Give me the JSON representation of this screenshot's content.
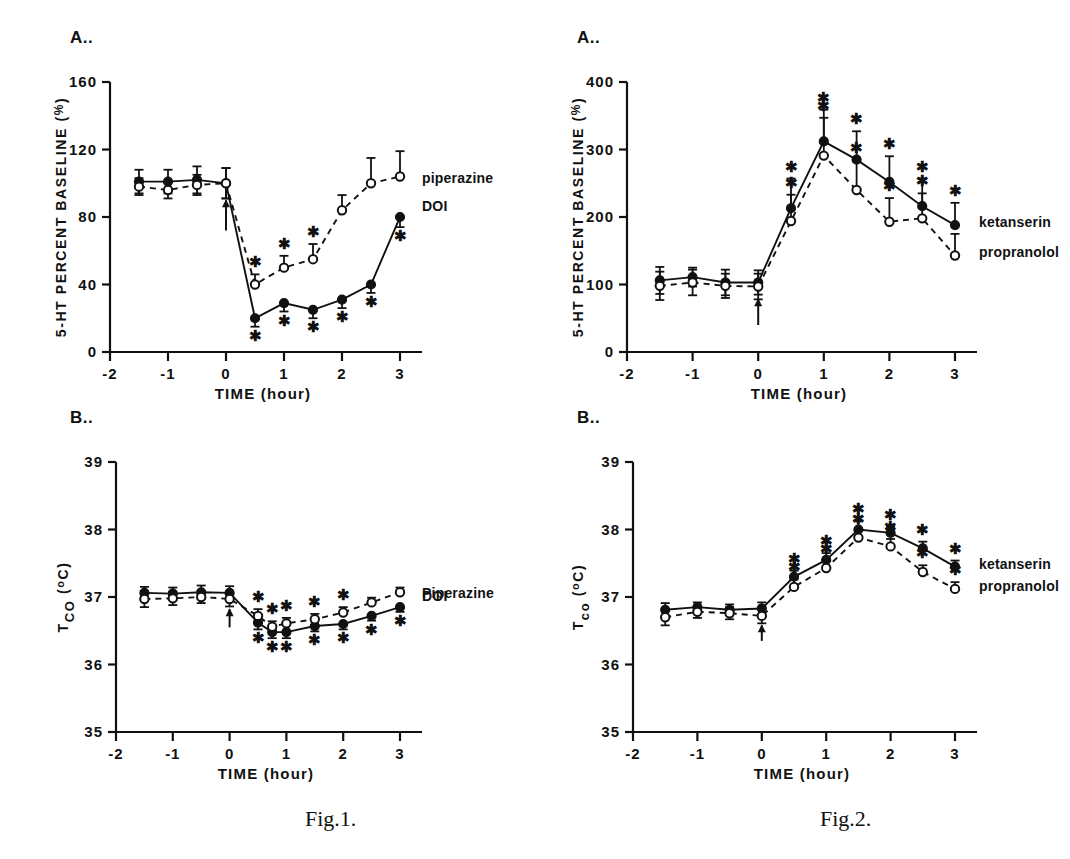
{
  "sheet": {
    "captions": [
      {
        "id": "fig1",
        "text": "Fig.1.",
        "x": 305,
        "y": 825
      },
      {
        "id": "fig2",
        "text": "Fig.2.",
        "x": 820,
        "y": 825
      }
    ]
  },
  "panels": {
    "fig1a": {
      "label": "A..",
      "ylabel": "5-HT PERCENT BASELINE (%)",
      "xlabel": "TIME (hour)",
      "legend": [
        {
          "name": "piperazine",
          "marker": "open-circle",
          "line": "dashed"
        },
        {
          "name": "DOI",
          "marker": "filled-circle",
          "line": "solid"
        }
      ]
    },
    "fig1b": {
      "label": "B..",
      "ylabel": "T co (°C)",
      "xlabel": "TIME (hour)",
      "legend": [
        {
          "name": "Piperazine",
          "marker": "open-circle",
          "line": "dashed"
        },
        {
          "name": "DOI",
          "marker": "filled-circle",
          "line": "solid"
        }
      ]
    },
    "fig2a": {
      "label": "A..",
      "ylabel": "5-HT PERCENT BASELINE (%)",
      "xlabel": "TIME (hour)",
      "legend": [
        {
          "name": "ketanserin",
          "marker": "filled-circle",
          "line": "solid"
        },
        {
          "name": "propranolol",
          "marker": "open-circle",
          "line": "dashed"
        }
      ]
    },
    "fig2b": {
      "label": "B..",
      "ylabel": "Tco (°C)",
      "xlabel": "TIME (hour)",
      "legend": [
        {
          "name": "ketanserin",
          "marker": "filled-circle",
          "line": "solid"
        },
        {
          "name": "propranolol",
          "marker": "open-circle",
          "line": "dashed"
        }
      ]
    }
  },
  "chart_data": [
    {
      "id": "fig1a",
      "type": "line",
      "title": "A..",
      "xlabel": "TIME (hour)",
      "ylabel": "5-HT PERCENT BASELINE (%)",
      "xlim": [
        -2,
        3
      ],
      "ylim": [
        0,
        160
      ],
      "xticks": [
        -2,
        -1,
        0,
        1,
        2,
        3
      ],
      "xtick_labels": [
        "-2",
        "-1",
        "0",
        "1",
        "2",
        "3"
      ],
      "yticks": [
        0,
        40,
        80,
        120,
        160
      ],
      "ytick_labels": [
        "0",
        "40",
        "80",
        "120",
        "160"
      ],
      "grid": false,
      "legend_position": "right-inside",
      "annotations": [
        {
          "type": "arrow",
          "x": 0,
          "y_from": 72,
          "y_to": 90,
          "note": "injection arrow at time 0"
        }
      ],
      "series": [
        {
          "name": "DOI",
          "marker": "filled-circle",
          "line": "solid",
          "x": [
            -1.5,
            -1.0,
            -0.5,
            0.0,
            0.5,
            1.0,
            1.5,
            2.0,
            2.5,
            3.0
          ],
          "values": [
            101,
            101,
            102,
            100,
            20,
            29,
            25,
            31,
            40,
            80
          ],
          "errors": [
            7,
            7,
            8,
            9,
            5,
            5,
            5,
            5,
            5,
            6
          ],
          "significance": [
            false,
            false,
            false,
            false,
            true,
            true,
            true,
            true,
            true,
            true
          ]
        },
        {
          "name": "piperazine",
          "marker": "open-circle",
          "line": "dashed",
          "x": [
            -1.5,
            -1.0,
            -0.5,
            0.0,
            0.5,
            1.0,
            1.5,
            2.0,
            2.5,
            3.0
          ],
          "values": [
            98,
            96,
            99,
            100,
            40,
            50,
            55,
            84,
            100,
            104
          ],
          "errors": [
            5,
            5,
            6,
            9,
            6,
            7,
            9,
            9,
            15,
            15
          ],
          "significance": [
            false,
            false,
            false,
            false,
            true,
            true,
            true,
            false,
            false,
            false
          ]
        }
      ]
    },
    {
      "id": "fig1b",
      "type": "line",
      "title": "B..",
      "xlabel": "TIME (hour)",
      "ylabel": "T co (°C)",
      "xlim": [
        -2,
        3
      ],
      "ylim": [
        35,
        39
      ],
      "xticks": [
        -2,
        -1,
        0,
        1,
        2,
        3
      ],
      "xtick_labels": [
        "-2",
        "-1",
        "0",
        "1",
        "2",
        "3"
      ],
      "yticks": [
        35,
        36,
        37,
        38,
        39
      ],
      "ytick_labels": [
        "35",
        "36",
        "37",
        "38",
        "39"
      ],
      "grid": false,
      "legend_position": "right-inside",
      "annotations": [
        {
          "type": "arrow",
          "x": 0,
          "y_from": 36.55,
          "y_to": 36.82,
          "note": "injection arrow at time 0"
        }
      ],
      "series": [
        {
          "name": "DOI",
          "marker": "filled-circle",
          "line": "solid",
          "x": [
            -1.5,
            -1.0,
            -0.5,
            0.0,
            0.5,
            0.75,
            1.0,
            1.5,
            2.0,
            2.5,
            3.0
          ],
          "values": [
            37.06,
            37.05,
            37.07,
            37.06,
            36.62,
            36.48,
            36.48,
            36.57,
            36.6,
            36.72,
            36.85
          ],
          "errors": [
            0.09,
            0.09,
            0.1,
            0.1,
            0.1,
            0.09,
            0.09,
            0.08,
            0.08,
            0.07,
            0.07
          ],
          "significance": [
            false,
            false,
            false,
            false,
            true,
            true,
            true,
            true,
            true,
            true,
            true
          ]
        },
        {
          "name": "Piperazine",
          "marker": "open-circle",
          "line": "dashed",
          "x": [
            -1.5,
            -1.0,
            -0.5,
            0.0,
            0.5,
            0.75,
            1.0,
            1.5,
            2.0,
            2.5,
            3.0
          ],
          "values": [
            36.97,
            36.98,
            37.0,
            36.97,
            36.72,
            36.56,
            36.61,
            36.67,
            36.77,
            36.92,
            37.07
          ],
          "errors": [
            0.12,
            0.1,
            0.09,
            0.11,
            0.1,
            0.08,
            0.08,
            0.08,
            0.08,
            0.07,
            0.07
          ],
          "significance": [
            false,
            false,
            false,
            false,
            true,
            true,
            true,
            true,
            true,
            false,
            false
          ]
        }
      ]
    },
    {
      "id": "fig2a",
      "type": "line",
      "title": "A..",
      "xlabel": "TIME (hour)",
      "ylabel": "5-HT PERCENT BASELINE (%)",
      "xlim": [
        -2,
        3
      ],
      "ylim": [
        0,
        400
      ],
      "xticks": [
        -2,
        -1,
        0,
        1,
        2,
        3
      ],
      "xtick_labels": [
        "-2",
        "-1",
        "0",
        "1",
        "2",
        "3"
      ],
      "yticks": [
        0,
        100,
        200,
        300,
        400
      ],
      "ytick_labels": [
        "0",
        "100",
        "200",
        "300",
        "400"
      ],
      "grid": false,
      "legend_position": "right-inside",
      "annotations": [
        {
          "type": "arrow",
          "x": 0,
          "y_from": 40,
          "y_to": 78,
          "note": "injection arrow at time 0"
        }
      ],
      "series": [
        {
          "name": "ketanserin",
          "marker": "filled-circle",
          "line": "solid",
          "x": [
            -1.5,
            -1.0,
            -0.5,
            0.0,
            0.5,
            1.0,
            1.5,
            2.0,
            2.5,
            3.0
          ],
          "values": [
            106,
            111,
            103,
            103,
            213,
            312,
            285,
            252,
            216,
            188
          ],
          "errors": [
            20,
            14,
            19,
            18,
            44,
            47,
            42,
            38,
            41,
            33
          ],
          "significance": [
            false,
            false,
            false,
            false,
            true,
            true,
            true,
            true,
            true,
            true
          ]
        },
        {
          "name": "propranolol",
          "marker": "open-circle",
          "line": "dashed",
          "x": [
            -1.5,
            -1.0,
            -0.5,
            0.0,
            0.5,
            1.0,
            1.5,
            2.0,
            2.5,
            3.0
          ],
          "values": [
            98,
            103,
            98,
            97,
            194,
            291,
            240,
            193,
            198,
            143
          ],
          "errors": [
            21,
            19,
            18,
            19,
            39,
            56,
            45,
            35,
            37,
            32
          ],
          "significance": [
            false,
            false,
            false,
            false,
            true,
            true,
            true,
            true,
            true,
            false
          ]
        }
      ]
    },
    {
      "id": "fig2b",
      "type": "line",
      "title": "B..",
      "xlabel": "TIME (hour)",
      "ylabel": "Tco (°C)",
      "xlim": [
        -2,
        3
      ],
      "ylim": [
        35,
        39
      ],
      "xticks": [
        -2,
        -1,
        0,
        1,
        2,
        3
      ],
      "xtick_labels": [
        "-2",
        "-1",
        "0",
        "1",
        "2",
        "3"
      ],
      "yticks": [
        35,
        36,
        37,
        38,
        39
      ],
      "ytick_labels": [
        "35",
        "36",
        "37",
        "38",
        "39"
      ],
      "grid": false,
      "legend_position": "right-inside",
      "annotations": [
        {
          "type": "arrow",
          "x": 0,
          "y_from": 36.35,
          "y_to": 36.58,
          "note": "injection arrow at time 0"
        }
      ],
      "series": [
        {
          "name": "ketanserin",
          "marker": "filled-circle",
          "line": "solid",
          "x": [
            -1.5,
            -1.0,
            -0.5,
            0.0,
            0.5,
            1.0,
            1.5,
            2.0,
            2.5,
            3.0
          ],
          "values": [
            36.81,
            36.85,
            36.81,
            36.83,
            37.3,
            37.55,
            38.0,
            37.95,
            37.72,
            37.45
          ],
          "errors": [
            0.1,
            0.07,
            0.08,
            0.09,
            0.09,
            0.1,
            0.12,
            0.09,
            0.1,
            0.09
          ],
          "significance": [
            false,
            false,
            false,
            false,
            true,
            true,
            true,
            true,
            true,
            true
          ]
        },
        {
          "name": "propranolol",
          "marker": "open-circle",
          "line": "dashed",
          "x": [
            -1.5,
            -1.0,
            -0.5,
            0.0,
            0.5,
            1.0,
            1.5,
            2.0,
            2.5,
            3.0
          ],
          "values": [
            36.7,
            36.78,
            36.76,
            36.72,
            37.15,
            37.43,
            37.88,
            37.75,
            37.37,
            37.12
          ],
          "errors": [
            0.12,
            0.09,
            0.09,
            0.11,
            0.11,
            0.11,
            0.1,
            0.11,
            0.1,
            0.1
          ],
          "significance": [
            false,
            false,
            false,
            false,
            true,
            true,
            true,
            true,
            true,
            true
          ]
        }
      ]
    }
  ]
}
